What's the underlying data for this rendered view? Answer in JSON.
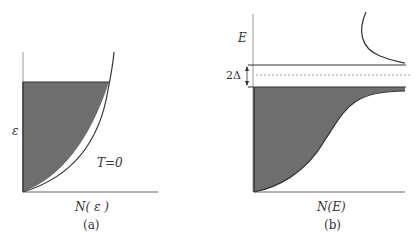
{
  "panel_a": {
    "y_axis_label": "ε",
    "x_axis_label": "N( ε )",
    "annotation": "T=0",
    "caption": "(a)"
  },
  "panel_b": {
    "y_axis_label": "E",
    "gap_label": "2Δ",
    "x_axis_label": "N(E)",
    "caption": "(b)"
  },
  "colors": {
    "fill": "#6e6e6e",
    "line": "#333333",
    "dashed": "#888888"
  }
}
